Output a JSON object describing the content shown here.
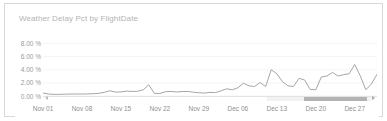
{
  "widget": {
    "title": "Weather Delay Pct by FlightDate"
  },
  "colors": {
    "line": "#a6a6a6",
    "grid": "#f4f4f4",
    "axis_text": "#8f8f8f",
    "title_text": "#b4b4b4",
    "border": "#d8d8d8",
    "scrollbar_thumb": "#b3b3b3",
    "scrollbar_track": "#f2f2f2",
    "background": "#ffffff"
  },
  "scrollbar": {
    "name": "horizontal-range-scrollbar",
    "left_arrow": "◀",
    "right_arrow": "▶",
    "thumb_start_pct": 36,
    "thumb_end_pct": 96
  },
  "chart_data": {
    "type": "line",
    "title": "Weather Delay Pct by FlightDate",
    "xlabel": "",
    "ylabel": "",
    "grid": true,
    "legend": false,
    "ylim": [
      0,
      9
    ],
    "ytick_labels": [
      "8.00 %",
      "6.00 %",
      "4.00 %",
      "2.00 %",
      "0.00 %"
    ],
    "ytick_values": [
      8,
      6,
      4,
      2,
      0
    ],
    "xtick_labels": [
      "Nov 01",
      "Nov 08",
      "Nov 15",
      "Nov 22",
      "Nov 29",
      "Dec 06",
      "Dec 13",
      "Dec 20",
      "Dec 27"
    ],
    "xtick_indices": [
      0,
      7,
      14,
      21,
      28,
      35,
      42,
      49,
      56
    ],
    "x": [
      "Nov 01",
      "Nov 02",
      "Nov 03",
      "Nov 04",
      "Nov 05",
      "Nov 06",
      "Nov 07",
      "Nov 08",
      "Nov 09",
      "Nov 10",
      "Nov 11",
      "Nov 12",
      "Nov 13",
      "Nov 14",
      "Nov 15",
      "Nov 16",
      "Nov 17",
      "Nov 18",
      "Nov 19",
      "Nov 20",
      "Nov 21",
      "Nov 22",
      "Nov 23",
      "Nov 24",
      "Nov 25",
      "Nov 26",
      "Nov 27",
      "Nov 28",
      "Nov 29",
      "Nov 30",
      "Dec 01",
      "Dec 02",
      "Dec 03",
      "Dec 04",
      "Dec 05",
      "Dec 06",
      "Dec 07",
      "Dec 08",
      "Dec 09",
      "Dec 10",
      "Dec 11",
      "Dec 12",
      "Dec 13",
      "Dec 14",
      "Dec 15",
      "Dec 16",
      "Dec 17",
      "Dec 18",
      "Dec 19",
      "Dec 20",
      "Dec 21",
      "Dec 22",
      "Dec 23",
      "Dec 24",
      "Dec 25",
      "Dec 26",
      "Dec 27",
      "Dec 28",
      "Dec 29",
      "Dec 30",
      "Dec 31"
    ],
    "series": [
      {
        "name": "Weather Delay Pct",
        "values": [
          0.45,
          0.3,
          0.25,
          0.25,
          0.28,
          0.3,
          0.3,
          0.3,
          0.32,
          0.35,
          0.4,
          0.55,
          0.8,
          0.6,
          0.62,
          0.75,
          0.7,
          0.72,
          0.95,
          1.7,
          0.4,
          0.38,
          0.65,
          0.7,
          0.62,
          0.68,
          0.7,
          0.58,
          0.5,
          0.45,
          0.55,
          0.52,
          0.8,
          1.1,
          0.95,
          1.25,
          1.95,
          1.55,
          1.45,
          2.05,
          1.45,
          4.0,
          3.4,
          2.2,
          1.55,
          1.45,
          2.7,
          2.45,
          1.0,
          0.95,
          2.9,
          3.05,
          3.6,
          3.05,
          3.25,
          3.4,
          4.8,
          3.05,
          0.95,
          1.85,
          3.3
        ]
      }
    ]
  }
}
